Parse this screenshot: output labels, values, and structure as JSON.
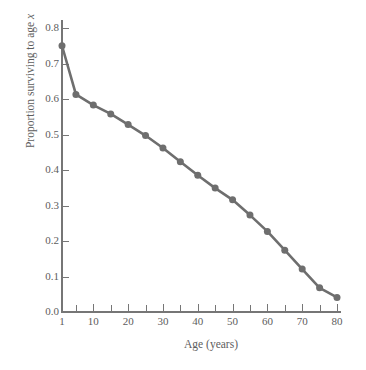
{
  "chart_data": {
    "type": "line",
    "title": "",
    "subtitle": "",
    "xlabel": "Age (years)",
    "ylabel": "Proportion surviving to age x",
    "ylabel_plain": "Proportion surviving to age ",
    "ylabel_italic": "x",
    "xlim": [
      1,
      80
    ],
    "ylim": [
      0.0,
      0.8
    ],
    "grid": false,
    "legend": null,
    "legend_position": "none",
    "marker": "filled-circle",
    "line_color": "#6e6e6e",
    "marker_color": "#6e6e6e",
    "axis_color": "#767676",
    "background_color": "#ffffff",
    "x_tick_labels": [
      "1",
      "10",
      "20",
      "30",
      "40",
      "50",
      "60",
      "70",
      "80"
    ],
    "x_tick_values": [
      1,
      10,
      20,
      30,
      40,
      50,
      60,
      70,
      80
    ],
    "x_minor_ticks": [
      5,
      15,
      25,
      35,
      45,
      55,
      65,
      75
    ],
    "y_tick_labels": [
      "0.0",
      "0.1",
      "0.2",
      "0.3",
      "0.4",
      "0.5",
      "0.6",
      "0.7",
      "0.8"
    ],
    "y_tick_values": [
      0.0,
      0.1,
      0.2,
      0.3,
      0.4,
      0.5,
      0.6,
      0.7,
      0.8
    ],
    "x": [
      1,
      5,
      10,
      15,
      20,
      25,
      30,
      35,
      40,
      45,
      50,
      55,
      60,
      65,
      70,
      75,
      80
    ],
    "values": [
      0.75,
      0.613,
      0.583,
      0.558,
      0.528,
      0.497,
      0.462,
      0.423,
      0.385,
      0.349,
      0.316,
      0.273,
      0.227,
      0.174,
      0.121,
      0.068,
      0.041
    ],
    "series": [
      {
        "name": "Survivorship",
        "x": [
          1,
          5,
          10,
          15,
          20,
          25,
          30,
          35,
          40,
          45,
          50,
          55,
          60,
          65,
          70,
          75,
          80
        ],
        "values": [
          0.75,
          0.613,
          0.583,
          0.558,
          0.528,
          0.497,
          0.462,
          0.423,
          0.385,
          0.349,
          0.316,
          0.273,
          0.227,
          0.174,
          0.121,
          0.068,
          0.041
        ]
      }
    ],
    "annotations": []
  }
}
